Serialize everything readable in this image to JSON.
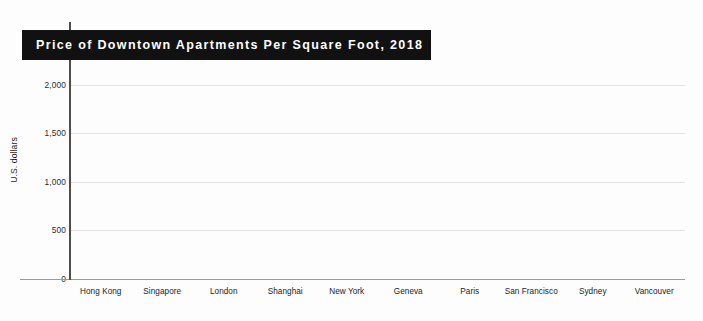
{
  "chart_data": {
    "type": "bar",
    "title": "Price of Downtown Apartments Per Square Foot, 2018",
    "xlabel": "",
    "ylabel": "U.S. dollars",
    "ylim": [
      0,
      2400
    ],
    "yticks": [
      0,
      500,
      1000,
      1500,
      2000
    ],
    "ytick_labels": [
      "0",
      "500",
      "1,000",
      "1,500",
      "2,000"
    ],
    "grid": true,
    "legend": false,
    "bar_color": "#4c4c4c",
    "title_band_color": "#111111",
    "title_text_color": "#ffffff",
    "categories": [
      "Hong Kong",
      "Singapore",
      "London",
      "Shanghai",
      "New York",
      "Geneva",
      "Paris",
      "San Francisco",
      "Sydney",
      "Vancouver"
    ],
    "values": [
      2280,
      1585,
      1470,
      1320,
      1125,
      1105,
      1000,
      960,
      810,
      790
    ]
  }
}
